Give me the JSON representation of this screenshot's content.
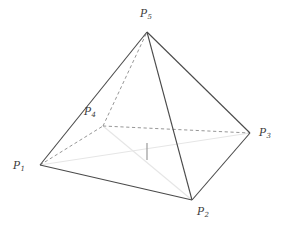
{
  "figure": {
    "type": "3d-geometry-diagram",
    "width": 288,
    "height": 230,
    "background_color": "#ffffff"
  },
  "colors": {
    "solid_edge": "#4a4a4a",
    "hidden_edge": "#8a8a8a",
    "diagonal": "#e6e6e6",
    "height_tick": "#9a9a9a",
    "label_text": "#3a3a3a"
  },
  "vertices": [
    {
      "id": "P1",
      "letter": "P",
      "subscript": "1",
      "x": 40,
      "y": 165,
      "label_x": 13,
      "label_y": 160,
      "visible": true
    },
    {
      "id": "P2",
      "letter": "P",
      "subscript": "2",
      "x": 192,
      "y": 200,
      "label_x": 197,
      "label_y": 206,
      "visible": true
    },
    {
      "id": "P3",
      "letter": "P",
      "subscript": "3",
      "x": 250,
      "y": 133,
      "label_x": 259,
      "label_y": 127,
      "visible": true
    },
    {
      "id": "P4",
      "letter": "P",
      "subscript": "4",
      "x": 103,
      "y": 126,
      "label_x": 84,
      "label_y": 106,
      "visible": true
    },
    {
      "id": "P5",
      "letter": "P",
      "subscript": "5",
      "x": 147,
      "y": 32,
      "label_x": 140,
      "label_y": 8,
      "visible": true
    }
  ],
  "edges": {
    "solid": [
      {
        "name": "edge-P1-P2",
        "from": "P1",
        "to": "P2"
      },
      {
        "name": "edge-P2-P3",
        "from": "P2",
        "to": "P3"
      },
      {
        "name": "edge-P1-P5",
        "from": "P1",
        "to": "P5"
      },
      {
        "name": "edge-P2-P5",
        "from": "P2",
        "to": "P5"
      },
      {
        "name": "edge-P3-P5",
        "from": "P3",
        "to": "P5"
      }
    ],
    "dashed": [
      {
        "name": "edge-P1-P4",
        "from": "P1",
        "to": "P4"
      },
      {
        "name": "edge-P4-P3",
        "from": "P4",
        "to": "P3"
      },
      {
        "name": "edge-P4-P5",
        "from": "P4",
        "to": "P5"
      }
    ],
    "diagonals": [
      {
        "name": "diagonal-P1-P3",
        "from": "P1",
        "to": "P3"
      },
      {
        "name": "diagonal-P4-P2",
        "from": "P4",
        "to": "P2"
      }
    ]
  },
  "height_marker": {
    "name": "pyramid-height-tick",
    "x": 147,
    "y_top": 143,
    "y_bottom": 160
  }
}
